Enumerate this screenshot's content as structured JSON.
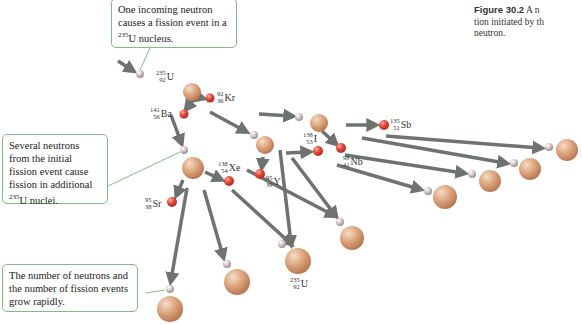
{
  "caption": {
    "figure_label": "Figure 30.2",
    "line1": "A n",
    "line2": "tion initiated by th",
    "line3": "neutron."
  },
  "callouts": {
    "top": {
      "text_pre": "One incoming neutron causes a fission event in a ",
      "sup": "235",
      "text_post": "U nucleus."
    },
    "middle": {
      "text_pre": "Several neutrons from the initial fission event cause fission in additional ",
      "sup": "235",
      "text_post": "U nuclei."
    },
    "bottom": {
      "text": "The number of neutrons and the number of fission events grow rapidly."
    }
  },
  "labels": {
    "u1": {
      "a": "235",
      "z": "92",
      "sym": "U"
    },
    "ba": {
      "a": "141",
      "z": "56",
      "sym": "Ba"
    },
    "kr": {
      "a": "92",
      "z": "36",
      "sym": "Kr"
    },
    "xe": {
      "a": "138",
      "z": "54",
      "sym": "Xe"
    },
    "sr": {
      "a": "95",
      "z": "38",
      "sym": "Sr"
    },
    "y": {
      "a": "95",
      "z": "39",
      "sym": "Y"
    },
    "i": {
      "a": "138",
      "z": "53",
      "sym": "I"
    },
    "nb": {
      "a": "98",
      "z": "41",
      "sym": "Nb"
    },
    "sb": {
      "a": "135",
      "z": "51",
      "sym": "Sb"
    },
    "u2": {
      "a": "235",
      "z": "92",
      "sym": "U"
    }
  },
  "colors": {
    "uranium": "#d9a07a",
    "fragment": "#e0463a",
    "neutron": "#c9b8bc",
    "arrow": "#6f736f",
    "callout_border": "#7dbf7d"
  }
}
